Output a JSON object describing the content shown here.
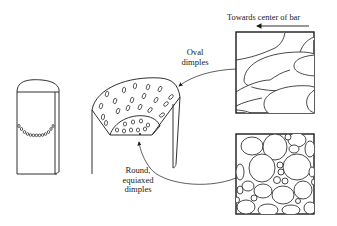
{
  "diagram": {
    "labels": {
      "direction": "Towards center of bar",
      "oval_line1": "Oval",
      "oval_line2": "dimples",
      "round_line1": "Round,",
      "round_line2": "equiaxed",
      "round_line3": "dimples"
    },
    "parts": [
      "fractured-bar-side-view",
      "fracture-surface-cup",
      "oval-dimples-micrograph",
      "round-dimples-micrograph"
    ],
    "colors": {
      "line": "#1a1a1a",
      "background": "#ffffff"
    }
  }
}
